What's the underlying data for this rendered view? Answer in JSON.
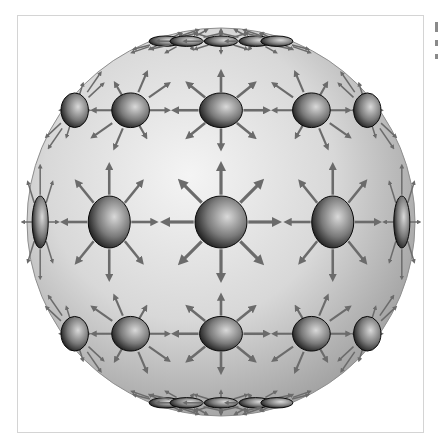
{
  "figure": {
    "sphere": {
      "cx": 221,
      "cy": 222,
      "r": 194,
      "highlight_color": "#f4f4f4",
      "mid_color": "#d8d8d8",
      "shadow_color": "#9c9c9c",
      "outline_color": "#8e8e8e"
    },
    "charge": {
      "base_radius": 26,
      "arrow_count": 8,
      "arrow_color": "#6b6b6b",
      "ball_light": "#d9d9d9",
      "ball_dark": "#111111"
    },
    "grid": {
      "latitudes_deg": [
        -72,
        -36,
        0,
        36,
        72
      ],
      "longitudes_deg": [
        -72,
        -36,
        0,
        36,
        72
      ],
      "poles": true
    },
    "frame_color": "#d4d4d4"
  },
  "edge_marks": [
    {
      "y": 4,
      "h": 10
    },
    {
      "y": 22,
      "h": 6
    },
    {
      "y": 36,
      "h": 5
    }
  ]
}
